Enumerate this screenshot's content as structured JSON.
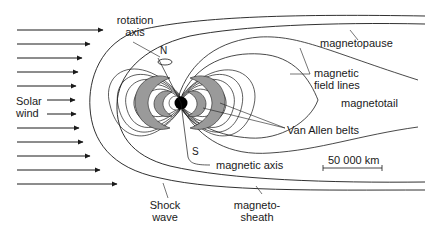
{
  "labels": {
    "rotation_axis_line1": "rotation",
    "rotation_axis_line2": "axis",
    "north": "N",
    "south": "S",
    "solar_wind_line1": "Solar",
    "solar_wind_line2": "wind",
    "magnetopause": "magnetopause",
    "magnetic_field_lines_line1": "magnetic",
    "magnetic_field_lines_line2": "field lines",
    "magnetotail": "magnetotail",
    "van_allen_belts": "Van Allen belts",
    "magnetic_axis": "magnetic axis",
    "scale_bar": "50 000 km",
    "shock_wave_line1": "Shock",
    "shock_wave_line2": "wave",
    "magnetosheath_line1": "magneto-",
    "magnetosheath_line2": "sheath"
  },
  "colors": {
    "line": "#1a1a1a",
    "belt_fill": "#9a9a9a",
    "earth": "#000000",
    "background": "#ffffff"
  },
  "solar_wind_arrow_count": 12
}
